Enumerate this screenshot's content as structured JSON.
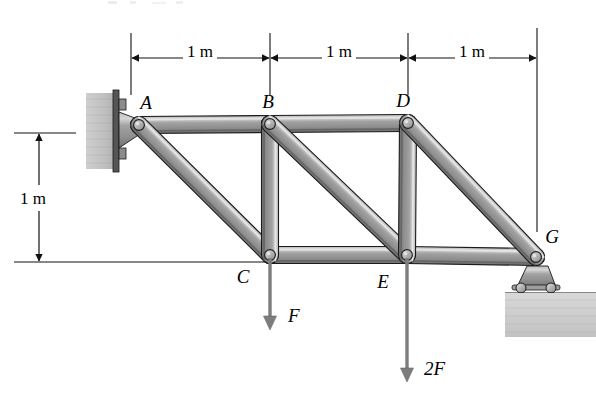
{
  "figure": {
    "type": "engineering-statics-truss-diagram"
  },
  "joints": [
    {
      "id": "A",
      "label": "A",
      "x": 139,
      "y": 125,
      "label_x": 146,
      "label_y": 109
    },
    {
      "id": "B",
      "label": "B",
      "x": 270,
      "y": 124,
      "label_x": 268,
      "label_y": 108
    },
    {
      "id": "D",
      "label": "D",
      "x": 408,
      "y": 123,
      "label_x": 403,
      "label_y": 107
    },
    {
      "id": "C",
      "label": "C",
      "x": 270,
      "y": 255,
      "label_x": 243,
      "label_y": 283
    },
    {
      "id": "E",
      "label": "E",
      "x": 407,
      "y": 255,
      "label_x": 383,
      "label_y": 288
    },
    {
      "id": "G",
      "label": "G",
      "x": 536,
      "y": 257,
      "label_x": 552,
      "label_y": 243
    }
  ],
  "members": [
    {
      "from": "A",
      "to": "B",
      "kind": "top-chord"
    },
    {
      "from": "B",
      "to": "D",
      "kind": "top-chord"
    },
    {
      "from": "C",
      "to": "E",
      "kind": "bottom-chord"
    },
    {
      "from": "E",
      "to": "G",
      "kind": "bottom-chord"
    },
    {
      "from": "A",
      "to": "C",
      "kind": "diagonal"
    },
    {
      "from": "B",
      "to": "C",
      "kind": "vertical"
    },
    {
      "from": "B",
      "to": "E",
      "kind": "diagonal"
    },
    {
      "from": "D",
      "to": "E",
      "kind": "vertical"
    },
    {
      "from": "D",
      "to": "G",
      "kind": "diagonal"
    }
  ],
  "dimensions": {
    "horizontal": [
      {
        "label": "1 m",
        "from_x": 131,
        "to_x": 270,
        "y": 58,
        "text_x": 200,
        "text_y": 52
      },
      {
        "label": "1 m",
        "from_x": 270,
        "to_x": 408,
        "y": 58,
        "text_x": 339,
        "text_y": 52
      },
      {
        "label": "1 m",
        "from_x": 408,
        "to_x": 537,
        "y": 58,
        "text_x": 472,
        "text_y": 52
      }
    ],
    "vertical": [
      {
        "label": "1 m",
        "x": 39,
        "from_y": 133,
        "to_y": 262,
        "text_x": 33,
        "text_y": 198
      }
    ],
    "extension_lines": [
      {
        "x": 131,
        "y1": 33,
        "y2": 95
      },
      {
        "x": 270,
        "y1": 33,
        "y2": 95
      },
      {
        "x": 408,
        "y1": 33,
        "y2": 95
      },
      {
        "x": 537,
        "y1": 28,
        "y2": 232
      }
    ],
    "witness_lines": [
      {
        "x1": 14,
        "y1": 133,
        "x2": 76,
        "y2": 133
      },
      {
        "x1": 14,
        "y1": 262,
        "x2": 268,
        "y2": 262
      }
    ]
  },
  "loads": [
    {
      "id": "load-F",
      "label": "F",
      "at_joint": "C",
      "x": 270,
      "from_y": 258,
      "to_y": 330,
      "label_x": 288,
      "label_y": 322,
      "direction": "down"
    },
    {
      "id": "load-2F",
      "label": "2F",
      "at_joint": "E",
      "x": 407,
      "from_y": 258,
      "to_y": 382,
      "label_x": 424,
      "label_y": 375,
      "direction": "down"
    }
  ],
  "supports": [
    {
      "id": "wall-mount",
      "type": "fixed-wall-bracket",
      "at_joint": "A",
      "x": 86,
      "y": 93,
      "width": 34,
      "height": 76
    },
    {
      "id": "roller-support",
      "type": "roller",
      "at_joint": "G",
      "x": 536,
      "y": 257,
      "ground_y": 288
    }
  ],
  "colors": {
    "member_fill": "#9a9a9a",
    "member_light": "#c9c9c9",
    "member_dark": "#6e6e6e",
    "member_stroke": "#1a1a1a",
    "pin_fill": "#b5b5b5",
    "wall_fill": "#c4c4c4",
    "ground_fill": "#d0d0d0",
    "arrow_fill": "#7d7d7d",
    "line_stroke": "#111111",
    "background": "#ffffff"
  }
}
